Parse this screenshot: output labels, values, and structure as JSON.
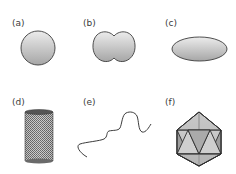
{
  "figure": {
    "panels": [
      {
        "id": "a",
        "label": "(a)",
        "shape": "sphere"
      },
      {
        "id": "b",
        "label": "(b)",
        "shape": "dumbbell"
      },
      {
        "id": "c",
        "label": "(c)",
        "shape": "ellipsoid"
      },
      {
        "id": "d",
        "label": "(d)",
        "shape": "cylinder-mesh"
      },
      {
        "id": "e",
        "label": "(e)",
        "shape": "flexible-chain"
      },
      {
        "id": "f",
        "label": "(f)",
        "shape": "icosahedron"
      }
    ],
    "colors": {
      "outline": "#3c3c3c",
      "fill_light": "#e6e6e6",
      "fill_dark": "#a8a8a8",
      "mesh": "#5a5a5a"
    }
  }
}
